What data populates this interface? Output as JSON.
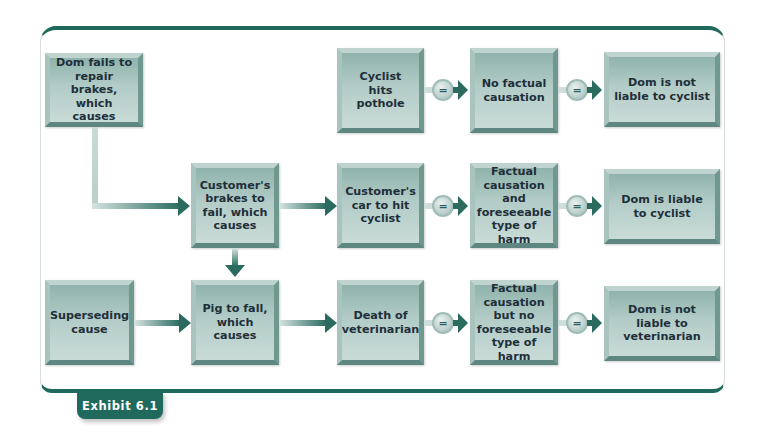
{
  "exhibit_label": "Exhibit 6.1",
  "nodes": {
    "dom_fails": "Dom fails to repair brakes, which causes",
    "cyclist_pothole": "Cyclist hits pothole",
    "no_factual_causation": "No factual causation",
    "not_liable_cyclist": "Dom is not liable to cyclist",
    "brakes_fail": "Customer's brakes to fail, which causes",
    "car_hits_cyclist": "Customer's car to hit cyclist",
    "factual_and_foreseeable": "Factual causation and foreseeable type of harm",
    "liable_cyclist": "Dom is liable to cyclist",
    "superseding_cause": "Superseding cause",
    "pig_fall": "Pig to fall, which causes",
    "death_vet": "Death of veterinarian",
    "factual_not_foreseeable": "Factual causation but no foreseeable type of harm",
    "not_liable_vet": "Dom is not liable to veterinarian"
  },
  "equals_symbol": "=",
  "colors": {
    "accent": "#1f6a5c",
    "arrow": "#2b6a5e",
    "box_fill": "#b3ccc7",
    "text": "#1e2f3a"
  },
  "edges": [
    {
      "from": "dom_fails",
      "to": "brakes_fail",
      "type": "arrow"
    },
    {
      "from": "brakes_fail",
      "to": "car_hits_cyclist",
      "type": "arrow"
    },
    {
      "from": "brakes_fail",
      "to": "pig_fall",
      "type": "arrow"
    },
    {
      "from": "superseding_cause",
      "to": "pig_fall",
      "type": "arrow"
    },
    {
      "from": "pig_fall",
      "to": "death_vet",
      "type": "arrow"
    },
    {
      "from": "cyclist_pothole",
      "to": "no_factual_causation",
      "type": "equals"
    },
    {
      "from": "no_factual_causation",
      "to": "not_liable_cyclist",
      "type": "equals"
    },
    {
      "from": "car_hits_cyclist",
      "to": "factual_and_foreseeable",
      "type": "equals"
    },
    {
      "from": "factual_and_foreseeable",
      "to": "liable_cyclist",
      "type": "equals"
    },
    {
      "from": "death_vet",
      "to": "factual_not_foreseeable",
      "type": "equals"
    },
    {
      "from": "factual_not_foreseeable",
      "to": "not_liable_vet",
      "type": "equals"
    }
  ]
}
